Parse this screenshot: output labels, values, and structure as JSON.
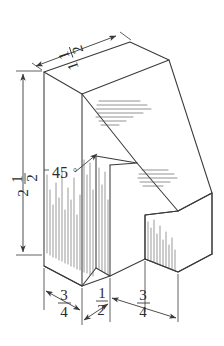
{
  "drawing": {
    "type": "isometric-technical-sketch",
    "description": "Hand-drawn isometric pictorial of a wedge block with a central vertical slot",
    "style": "pencil-sketch",
    "line_color": "#3a3a3a",
    "background_color": "#ffffff"
  },
  "dimensions": {
    "top_depth": {
      "label": "1 1/2",
      "whole": "1",
      "numerator": "1",
      "denominator": "2",
      "axis": "top-receding-edge"
    },
    "overall_height": {
      "label": "2 1/2",
      "whole": "2",
      "numerator": "1",
      "denominator": "2",
      "axis": "left-vertical"
    },
    "bottom_left_width": {
      "label": "3/4",
      "whole": "",
      "numerator": "3",
      "denominator": "4",
      "axis": "bottom-front-left"
    },
    "slot_width": {
      "label": "1/2",
      "whole": "",
      "numerator": "1",
      "denominator": "2",
      "axis": "bottom-front-middle"
    },
    "bottom_right_width": {
      "label": "3/4",
      "whole": "",
      "numerator": "3",
      "denominator": "4",
      "axis": "bottom-front-right"
    }
  },
  "annotations": {
    "angle": {
      "value": "45",
      "symbol": "°",
      "label": "45°",
      "points_to": "inclined-face-edge"
    }
  },
  "shading": {
    "upper_face_lines": 7,
    "lower_face_lines": 5,
    "front_left_hatch": 26,
    "front_right_hatch": 24,
    "side_hatch": 18
  }
}
